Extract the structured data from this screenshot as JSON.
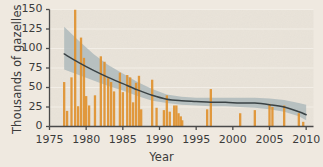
{
  "chart_data": {
    "type": "bar",
    "title": "",
    "subtitle": "",
    "xlabel": "Year",
    "ylabel": "Thousands of gazelles",
    "xlim": [
      1975,
      2011
    ],
    "ylim": [
      0,
      150
    ],
    "xticks": [
      1975,
      1980,
      1985,
      1990,
      1995,
      2000,
      2005,
      2010
    ],
    "yticks": [
      0,
      25,
      50,
      75,
      100,
      125,
      150
    ],
    "grid": "horizontal-white-faint",
    "legend": "none",
    "annotations": [],
    "series": [
      {
        "name": "Survey counts",
        "type": "bar",
        "color": "#e0912f",
        "unit": "thousands of gazelles",
        "points": [
          {
            "x": 1977.0,
            "y": 57
          },
          {
            "x": 1977.4,
            "y": 20
          },
          {
            "x": 1978.0,
            "y": 63
          },
          {
            "x": 1978.5,
            "y": 150
          },
          {
            "x": 1978.9,
            "y": 26
          },
          {
            "x": 1979.3,
            "y": 114
          },
          {
            "x": 1979.7,
            "y": 88
          },
          {
            "x": 1980.0,
            "y": 39
          },
          {
            "x": 1980.4,
            "y": 27
          },
          {
            "x": 1981.2,
            "y": 40
          },
          {
            "x": 1982.0,
            "y": 90
          },
          {
            "x": 1982.5,
            "y": 83
          },
          {
            "x": 1983.0,
            "y": 62
          },
          {
            "x": 1983.4,
            "y": 57
          },
          {
            "x": 1983.8,
            "y": 45
          },
          {
            "x": 1984.6,
            "y": 69
          },
          {
            "x": 1985.0,
            "y": 44
          },
          {
            "x": 1985.6,
            "y": 66
          },
          {
            "x": 1986.0,
            "y": 63
          },
          {
            "x": 1986.4,
            "y": 31
          },
          {
            "x": 1986.8,
            "y": 56
          },
          {
            "x": 1987.2,
            "y": 65
          },
          {
            "x": 1987.5,
            "y": 22
          },
          {
            "x": 1989.0,
            "y": 60
          },
          {
            "x": 1989.6,
            "y": 24
          },
          {
            "x": 1990.6,
            "y": 21
          },
          {
            "x": 1991.0,
            "y": 40
          },
          {
            "x": 1991.4,
            "y": 19
          },
          {
            "x": 1992.0,
            "y": 27
          },
          {
            "x": 1992.3,
            "y": 27
          },
          {
            "x": 1992.6,
            "y": 17
          },
          {
            "x": 1992.9,
            "y": 13
          },
          {
            "x": 1993.1,
            "y": 8
          },
          {
            "x": 1996.5,
            "y": 22
          },
          {
            "x": 1997.0,
            "y": 48
          },
          {
            "x": 2001.0,
            "y": 17
          },
          {
            "x": 2003.0,
            "y": 21
          },
          {
            "x": 2005.0,
            "y": 29
          },
          {
            "x": 2005.4,
            "y": 25
          },
          {
            "x": 2007.0,
            "y": 27
          },
          {
            "x": 2009.0,
            "y": 17
          },
          {
            "x": 2009.6,
            "y": 6
          }
        ]
      },
      {
        "name": "Fitted trend",
        "type": "line",
        "color": "#3a4244",
        "x": [
          1977,
          1979,
          1981,
          1983,
          1985,
          1987,
          1989,
          1991,
          1993,
          1995,
          1997,
          1999,
          2001,
          2003,
          2005,
          2007,
          2009,
          2010
        ],
        "y": [
          93,
          82,
          72,
          63,
          55,
          47,
          40,
          35,
          33,
          32,
          31,
          31,
          30,
          30,
          28,
          25,
          19,
          15
        ]
      },
      {
        "name": "Confidence band",
        "type": "area",
        "color": "#a9b6b9",
        "x": [
          1977,
          1979,
          1981,
          1983,
          1985,
          1987,
          1989,
          1991,
          1993,
          1995,
          1997,
          1999,
          2001,
          2003,
          2005,
          2007,
          2009,
          2010
        ],
        "y_upper": [
          128,
          110,
          93,
          79,
          68,
          57,
          48,
          41,
          38,
          37,
          37,
          37,
          37,
          37,
          36,
          34,
          30,
          28
        ],
        "y_lower": [
          73,
          66,
          59,
          52,
          46,
          39,
          33,
          30,
          28,
          27,
          26,
          26,
          25,
          24,
          22,
          19,
          13,
          8
        ]
      }
    ]
  },
  "figure": {
    "background_color": "#efe9e0",
    "plot_background_color": "#e9e3d9",
    "axis_color": "#4a4a4a",
    "gridline_color": "#f5f1ea"
  }
}
